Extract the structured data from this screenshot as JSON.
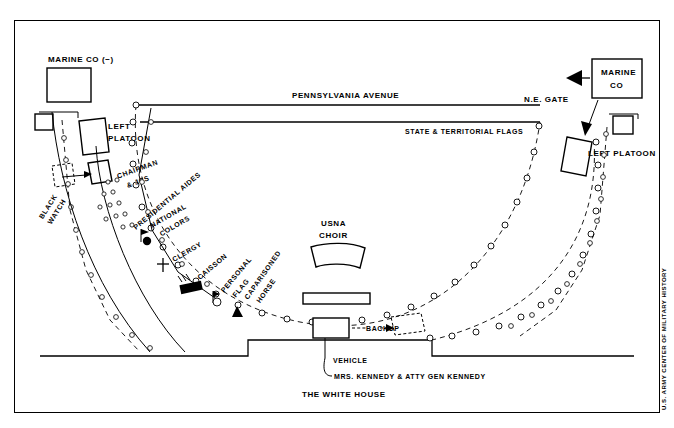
{
  "figure": {
    "credit": "U.S. ARMY CENTER OF MILITARY HISTORY",
    "bottom_label": "THE WHITE HOUSE",
    "avenue_label": "PENNSYLVANIA AVENUE",
    "flags_label": "STATE & TERRITORIAL FLAGS",
    "gate_label": "N.E. GATE"
  },
  "units": {
    "marine_co_left": "MARINE CO (−)",
    "marine_co_right_line1": "MARINE",
    "marine_co_right_line2": "CO",
    "left_platoon_left_line1": "LEFT",
    "left_platoon_left_line2": "PLATOON",
    "left_platoon_right": "LEFT PLATOON",
    "black_watch_line1": "BLACK",
    "black_watch_line2": "WATCH"
  },
  "procession": {
    "chairman_line1": "CHAIRMAN",
    "chairman_line2": "& JCS",
    "presidential_aides": "PRESIDENTIAL AIDES",
    "national_colors_line1": "NATIONAL",
    "national_colors_line2": "COLORS",
    "clergy": "CLERGY",
    "caisson": "CAISSON",
    "personal_flag_line1": "PERSONAL",
    "personal_flag_line2": "FLAG",
    "caparisoned_horse_line1": "CAPARISONED",
    "caparisoned_horse_line2": "HORSE"
  },
  "center": {
    "usna_line1": "USNA",
    "usna_line2": "CHOIR"
  },
  "vehicles": {
    "backup": "BACKUP",
    "vehicle": "VEHICLE",
    "occupants": "MRS. KENNEDY & ATTY GEN KENNEDY"
  },
  "colors": {
    "ink": "#000000",
    "paper": "#ffffff"
  }
}
